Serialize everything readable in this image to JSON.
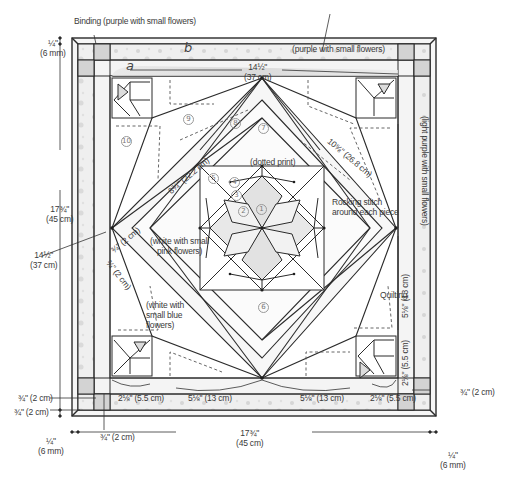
{
  "diagram": {
    "title_fragment": "",
    "colors": {
      "line": "#2b2b2b",
      "fabric_light": "#f1f1f1",
      "fabric_mid": "#dcdcdc",
      "fabric_dark": "#c8c8c8",
      "background": "#ffffff"
    },
    "callouts": {
      "binding": "Binding (purple with small flowers)",
      "border_top": "(purple with small flowers)",
      "border_right": "(light purple with small flowers)",
      "dotted_print": "(dotted print)",
      "rocking_stitch_line1": "Rocking stitch",
      "rocking_stitch_line2": "around each piece",
      "white_pink_line1": "(white with small",
      "white_pink_line2": "pink flowers)",
      "white_blue_line1": "(white with",
      "white_blue_line2": "small blue",
      "white_blue_line3": "flowers)",
      "quilting": "Quilting"
    },
    "strip_letters": {
      "a": "a",
      "b": "b"
    },
    "dimensions": {
      "top_center_in": "14½\"",
      "top_center_cm": "(37 cm)",
      "left_outer_in": "17¾\"",
      "left_outer_cm": "(45 cm)",
      "left_inner_in": "14½\"",
      "left_inner_cm": "(37 cm)",
      "binding_tl_in": "¼\"",
      "binding_tl_cm": "(6 mm)",
      "binding_bl_in": "¼\"",
      "binding_bl_cm": "(6 mm)",
      "binding_br_in": "¼\"",
      "binding_br_cm": "(6 mm)",
      "bottom_outer_in": "17¾\"",
      "bottom_outer_cm": "(45 cm)",
      "diag_left": "8¾\" (22.2 cm)",
      "diag_right": "10⅝\" (26.8 cm)",
      "small_strip_1": "¾\" (2 cm)",
      "small_strip_2": "¾\" (2 cm)",
      "bottom_seg_left": "2⅛\" (5.5 cm)",
      "bottom_seg_mid_left": "5⅛\" (13 cm)",
      "bottom_seg_mid_right": "5⅛\" (13 cm)",
      "bottom_seg_right": "2⅛\" (5.5 cm)",
      "right_seg_upper": "5⅛\" (13 cm)",
      "right_seg_lower": "2⅛\" (5.5 cm)",
      "left_strip_1": "¾\" (2 cm)",
      "left_strip_2": "¾\" (2 cm)",
      "bottom_strip": "¾\" (2 cm)",
      "right_strip": "¾\" (2 cm)"
    },
    "piece_numbers": [
      "1",
      "2",
      "3",
      "4",
      "5",
      "6",
      "7",
      "8",
      "9",
      "10"
    ]
  }
}
